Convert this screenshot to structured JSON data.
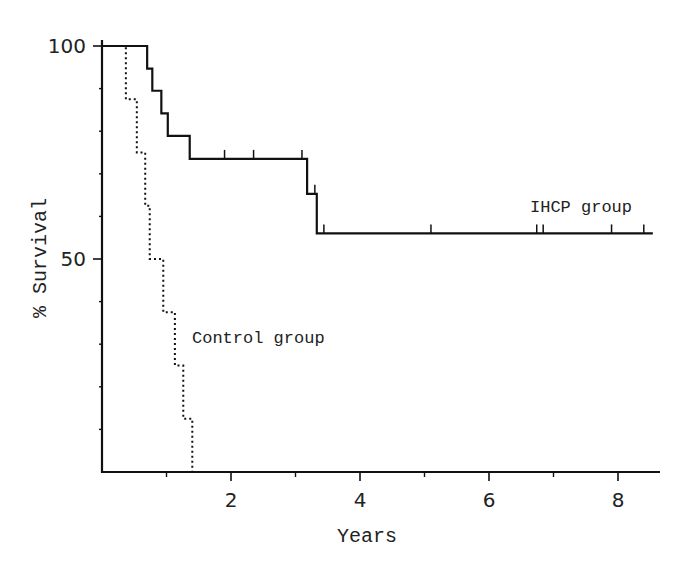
{
  "chart_data": {
    "type": "line",
    "subtype": "kaplan-meier step",
    "title": "",
    "xlabel": "Years",
    "ylabel": "% Survival",
    "xlim": [
      0,
      8.6
    ],
    "ylim": [
      0,
      100
    ],
    "x_ticks_major": [
      2,
      4,
      6,
      8
    ],
    "x_ticks_minor": [
      1,
      3,
      5,
      7
    ],
    "y_ticks_major": [
      50,
      100
    ],
    "y_ticks_minor": [
      10,
      20,
      30,
      40,
      60,
      70,
      80,
      90
    ],
    "grid": false,
    "legend": "inline labels",
    "series": [
      {
        "name": "IHCP group",
        "style": "solid",
        "steps": [
          {
            "t": 0,
            "s": 100
          },
          {
            "t": 0.7,
            "s": 94.7
          },
          {
            "t": 0.78,
            "s": 89.5
          },
          {
            "t": 0.92,
            "s": 84.2
          },
          {
            "t": 1.02,
            "s": 78.9
          },
          {
            "t": 1.36,
            "s": 73.5
          },
          {
            "t": 3.18,
            "s": 65.3
          },
          {
            "t": 3.33,
            "s": 56.0
          }
        ],
        "end_t": 8.54,
        "censored": [
          {
            "t": 1.9,
            "s": 73.5
          },
          {
            "t": 2.35,
            "s": 73.5
          },
          {
            "t": 3.1,
            "s": 73.5
          },
          {
            "t": 3.3,
            "s": 65.3
          },
          {
            "t": 3.44,
            "s": 56.0
          },
          {
            "t": 5.1,
            "s": 56.0
          },
          {
            "t": 6.74,
            "s": 56.0
          },
          {
            "t": 6.84,
            "s": 56.0
          },
          {
            "t": 7.9,
            "s": 56.0
          },
          {
            "t": 8.4,
            "s": 56.0
          }
        ],
        "label_pos": {
          "t": 6.6,
          "s": 59
        }
      },
      {
        "name": "Control group",
        "style": "dotted",
        "steps": [
          {
            "t": 0,
            "s": 100
          },
          {
            "t": 0.37,
            "s": 87.5
          },
          {
            "t": 0.54,
            "s": 75.0
          },
          {
            "t": 0.67,
            "s": 62.5
          },
          {
            "t": 0.74,
            "s": 50.0
          },
          {
            "t": 0.95,
            "s": 37.5
          },
          {
            "t": 1.13,
            "s": 25.0
          },
          {
            "t": 1.26,
            "s": 12.5
          },
          {
            "t": 1.4,
            "s": 0
          }
        ],
        "end_t": 1.4,
        "censored": [],
        "label_pos": {
          "t": 1.5,
          "s": 30
        }
      }
    ]
  },
  "labels": {
    "xlabel": "Years",
    "ylabel": "% Survival",
    "ihcp": "IHCP group",
    "control": "Control group",
    "y100": "100",
    "y50": "50",
    "x2": "2",
    "x4": "4",
    "x6": "6",
    "x8": "8"
  }
}
